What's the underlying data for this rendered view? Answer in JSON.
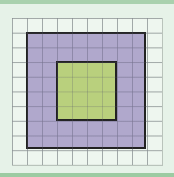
{
  "diagram": {
    "type": "area-model-grid",
    "grid": {
      "columns": 10,
      "rows": 10
    },
    "outer_square": {
      "side_units": 8,
      "color": "#9687be"
    },
    "inner_square": {
      "side_units": 4,
      "color": "#b9d278"
    },
    "background_color": "#e6f2e8",
    "accent_band_color": "#a9d1ae"
  }
}
